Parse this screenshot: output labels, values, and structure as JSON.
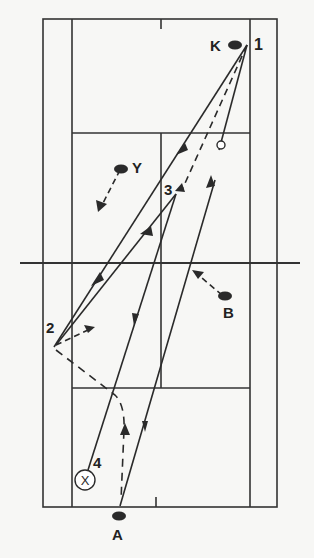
{
  "diagram": {
    "type": "badminton-court-rally-diagram",
    "colors": {
      "background": "#f7f7f5",
      "line": "#333333",
      "marker": "#2a2a2a"
    },
    "players": [
      {
        "id": "K",
        "label": "K"
      },
      {
        "id": "Y",
        "label": "Y"
      },
      {
        "id": "B",
        "label": "B"
      },
      {
        "id": "A",
        "label": "A"
      }
    ],
    "shot_numbers": [
      "1",
      "2",
      "3",
      "4"
    ],
    "symbols": {
      "end_marker": "X",
      "shuttle_marker": "open-circle"
    }
  }
}
